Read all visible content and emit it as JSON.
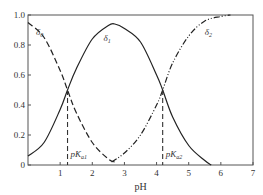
{
  "chart_data": {
    "type": "line",
    "title": "",
    "xlabel": "pH",
    "ylabel": "",
    "xlim": [
      0,
      7
    ],
    "ylim": [
      0,
      1.0
    ],
    "xticks": [
      "1",
      "2",
      "3",
      "4",
      "5",
      "6",
      "7"
    ],
    "yticks": [
      "0",
      "0.2",
      "0.4",
      "0.6",
      "0.8",
      "1.0"
    ],
    "grid": false,
    "pKa1": 1.23,
    "pKa2": 4.19,
    "series": [
      {
        "name": "δ0",
        "label": "δ",
        "sub": "0",
        "style": "dashed",
        "x": [
          0,
          0.5,
          1.0,
          1.23,
          1.5,
          2.0,
          2.5,
          2.7
        ],
        "y": [
          0.95,
          0.85,
          0.63,
          0.5,
          0.35,
          0.15,
          0.04,
          0.02
        ]
      },
      {
        "name": "δ1",
        "label": "δ",
        "sub": "1",
        "style": "solid",
        "x": [
          0,
          0.5,
          1.0,
          1.23,
          1.5,
          2.0,
          2.5,
          2.7,
          3.0,
          3.5,
          4.0,
          4.19,
          4.5,
          5.0,
          5.5,
          5.7
        ],
        "y": [
          0.06,
          0.15,
          0.37,
          0.5,
          0.64,
          0.84,
          0.93,
          0.94,
          0.91,
          0.82,
          0.6,
          0.5,
          0.32,
          0.13,
          0.03,
          0.0
        ]
      },
      {
        "name": "δ2",
        "label": "δ",
        "sub": "2",
        "style": "dash-dot-dot",
        "x": [
          2.6,
          3.0,
          3.5,
          4.0,
          4.19,
          4.5,
          5.0,
          5.5,
          6.0,
          6.3
        ],
        "y": [
          0.02,
          0.08,
          0.2,
          0.4,
          0.5,
          0.68,
          0.86,
          0.96,
          0.99,
          1.0
        ]
      }
    ],
    "annotations": [
      {
        "name": "pka1-label",
        "text": "pK",
        "sub": "a1",
        "x": 1.23
      },
      {
        "name": "pka2-label",
        "text": "pK",
        "sub": "a2",
        "x": 4.19
      }
    ]
  }
}
